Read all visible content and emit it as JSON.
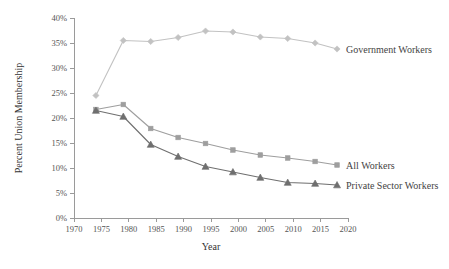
{
  "chart_data": {
    "type": "line",
    "title": "",
    "xlabel": "Year",
    "ylabel": "Percent Union Membership",
    "xlim": [
      1970,
      2020
    ],
    "ylim": [
      0,
      40
    ],
    "xticks": [
      1970,
      1975,
      1980,
      1985,
      1990,
      1995,
      2000,
      2005,
      2010,
      2015,
      2020
    ],
    "xtick_labels": [
      "1970",
      "1975",
      "1980",
      "1985",
      "1990",
      "1995",
      "2000",
      "2005",
      "2010",
      "2015",
      "2020"
    ],
    "yticks": [
      0,
      5,
      10,
      15,
      20,
      25,
      30,
      35,
      40
    ],
    "ytick_labels": [
      "0%",
      "5%",
      "10%",
      "15%",
      "20%",
      "25%",
      "30%",
      "35%",
      "40%"
    ],
    "grid": false,
    "legend_position": "right-inline-labels",
    "x": [
      1974,
      1979,
      1984,
      1989,
      1994,
      1999,
      2004,
      2009,
      2014,
      2018
    ],
    "series": [
      {
        "name": "Government Workers",
        "color": "#c2c2c2",
        "marker": "diamond",
        "label_x": 2020,
        "values": [
          24.5,
          35.5,
          35.3,
          36.1,
          37.4,
          37.2,
          36.2,
          35.9,
          35.0,
          33.8
        ]
      },
      {
        "name": "All Workers",
        "color": "#9e9e9e",
        "marker": "square",
        "label_x": 2020,
        "values": [
          21.7,
          22.7,
          17.9,
          16.1,
          14.9,
          13.6,
          12.6,
          12.0,
          11.3,
          10.6
        ]
      },
      {
        "name": "Private Sector Workers",
        "color": "#6f6f6f",
        "marker": "triangle",
        "label_x": 2020,
        "values": [
          21.5,
          20.3,
          14.7,
          12.3,
          10.3,
          9.2,
          8.1,
          7.1,
          6.9,
          6.6
        ]
      }
    ]
  },
  "labels": {
    "y_axis_title": "Percent Union Membership",
    "x_axis_title": "Year",
    "government_workers": "Government Workers",
    "all_workers": "All Workers",
    "private_sector_workers": "Private Sector Workers"
  },
  "colors": {
    "government": "#c2c2c2",
    "all": "#9e9e9e",
    "private": "#6f6f6f",
    "axis": "#9a9a9a",
    "text": "#444444",
    "background": "#ffffff"
  }
}
